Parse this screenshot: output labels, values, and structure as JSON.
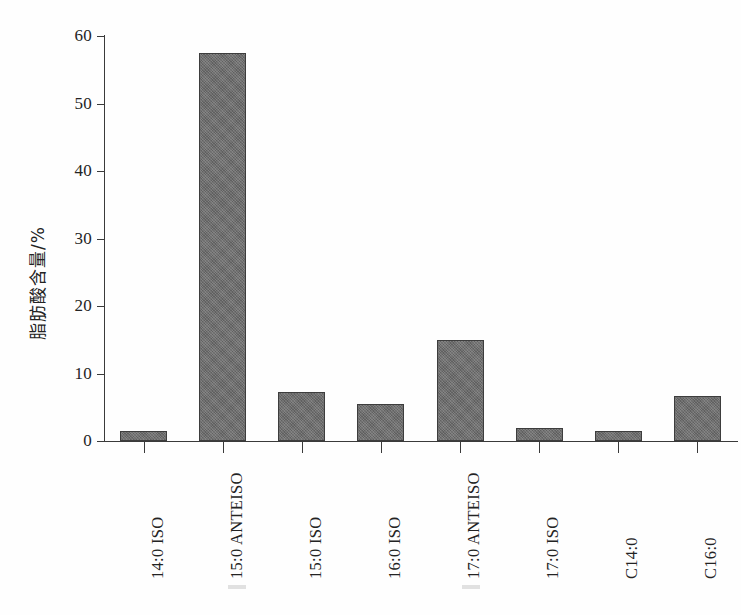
{
  "figure": {
    "background_color": "#ffffff",
    "ink_color": "#2b2b2b",
    "bar_fill_color": "#6b6b6b",
    "bar_edge_color": "#3d3d3d"
  },
  "axes": {
    "y_title": "脂肪酸含量/%",
    "y_ticks": [
      "0",
      "10",
      "20",
      "30",
      "40",
      "50",
      "60"
    ],
    "x_title": ""
  },
  "chart_data": {
    "type": "bar",
    "title": "",
    "xlabel": "",
    "ylabel": "脂肪酸含量/%",
    "ylim": [
      0,
      60
    ],
    "ytick_step": 10,
    "grid": false,
    "legend": "none",
    "categories": [
      "14:0 ISO",
      "15:0 ANTEISO",
      "15:0 ISO",
      "16:0 ISO",
      "17:0 ANTEISO",
      "17:0 ISO",
      "C14:0",
      "C16:0"
    ],
    "values": [
      1.5,
      57.5,
      7.2,
      5.5,
      14.9,
      1.9,
      1.5,
      6.6
    ]
  }
}
